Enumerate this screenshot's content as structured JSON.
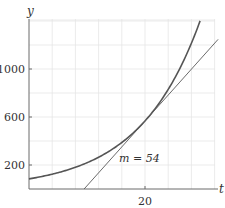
{
  "chart_data": {
    "type": "line",
    "title": "",
    "xlabel": "t",
    "ylabel": "y",
    "xlim": [
      0,
      32.6
    ],
    "ylim": [
      0,
      1410
    ],
    "grid": true,
    "x_ticks": [
      {
        "value": 20,
        "label": "20"
      }
    ],
    "y_ticks": [
      {
        "value": 200,
        "label": "200"
      },
      {
        "value": 600,
        "label": "600"
      },
      {
        "value": 1000,
        "label": "1000"
      }
    ],
    "x_grid_step": 4,
    "y_grid_step": 200,
    "series": [
      {
        "name": "exponential curve",
        "formula": "y = 567 * exp(0.0952 * (t - 20))",
        "x": [
          0,
          4,
          8,
          12,
          16,
          20,
          24,
          28,
          29.5
        ],
        "values": [
          84,
          123,
          181,
          264,
          387,
          567,
          831,
          1217,
          1400
        ]
      },
      {
        "name": "tangent line at t = 20",
        "slope": 54,
        "x": [
          9.5,
          20,
          32.6
        ],
        "values": [
          0,
          567,
          1247
        ]
      }
    ],
    "annotations": [
      {
        "text": "m = 54",
        "x": 21,
        "y": 230
      }
    ],
    "tangent_point": {
      "t": 20,
      "y": 567
    }
  },
  "labels": {
    "x_axis": "t",
    "y_axis": "y",
    "x_tick_20": "20",
    "y_tick_200": "200",
    "y_tick_600": "600",
    "y_tick_1000": "1000",
    "annotation": "m = 54"
  }
}
